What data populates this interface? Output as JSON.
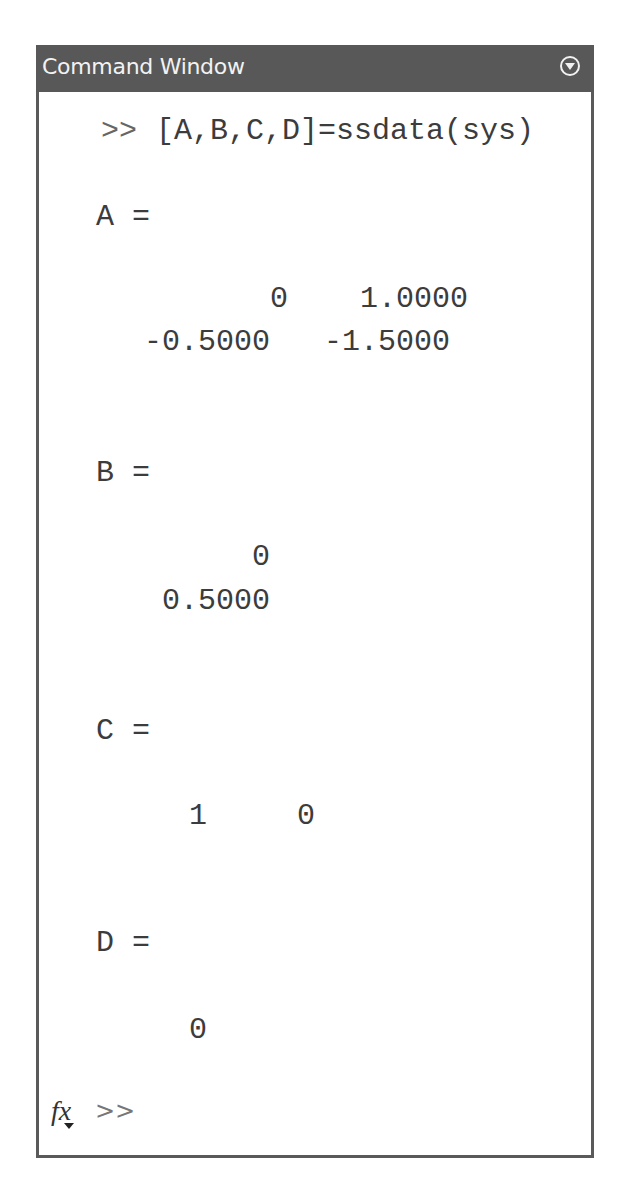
{
  "window": {
    "title": "Command Window",
    "menu_icon": "circle-chevron-down-icon"
  },
  "console": {
    "command_prompt": ">>",
    "command": "[A,B,C,D]=ssdata(sys)",
    "outputs": {
      "A": {
        "label": "A =",
        "rows": [
          "       0    1.0000",
          "-0.5000   -1.5000"
        ]
      },
      "B": {
        "label": "B =",
        "rows": [
          "      0",
          " 0.5000"
        ]
      },
      "C": {
        "label": "C =",
        "rows": [
          "1     0"
        ]
      },
      "D": {
        "label": "D =",
        "rows": [
          "0"
        ]
      }
    }
  },
  "input": {
    "fx_icon": "fx-icon",
    "prompt": ">>",
    "value": ""
  }
}
